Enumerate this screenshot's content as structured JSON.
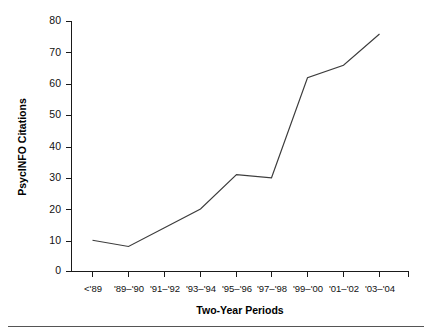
{
  "chart_data": {
    "type": "line",
    "title": "",
    "xlabel": "Two-Year Periods",
    "ylabel": "PsycINFO Citations",
    "categories": [
      "<'89",
      "'89–'90",
      "'91–'92",
      "'93–'94",
      "'95–'96",
      "'97–'98",
      "'99–'00",
      "'01–'02",
      "'03–'04"
    ],
    "values": [
      10,
      8,
      14,
      20,
      31,
      30,
      62,
      66,
      76
    ],
    "series": [
      {
        "name": "PsycINFO Citations",
        "values": [
          10,
          8,
          14,
          20,
          31,
          30,
          62,
          66,
          76
        ]
      }
    ],
    "ylim": [
      0,
      80
    ],
    "yticks": [
      0,
      10,
      20,
      30,
      40,
      50,
      60,
      70,
      80
    ],
    "ytick_labels": [
      "0",
      "10",
      "20",
      "30",
      "40",
      "50",
      "60",
      "70",
      "80"
    ],
    "grid": false,
    "legend": false,
    "line_color": "#3c3c3c",
    "axis_color": "#1a1a1a",
    "background": "#ffffff"
  },
  "axes": {
    "y_title": "PsycINFO Citations",
    "x_title": "Two-Year Periods"
  },
  "ticks": {
    "y": [
      {
        "label": "80",
        "value": 80
      },
      {
        "label": "70",
        "value": 70
      },
      {
        "label": "60",
        "value": 60
      },
      {
        "label": "50",
        "value": 50
      },
      {
        "label": "40",
        "value": 40
      },
      {
        "label": "30",
        "value": 30
      },
      {
        "label": "20",
        "value": 20
      },
      {
        "label": "10",
        "value": 10
      },
      {
        "label": "0",
        "value": 0
      }
    ],
    "x": [
      {
        "label": "<'89"
      },
      {
        "label": "'89–'90"
      },
      {
        "label": "'91–'92"
      },
      {
        "label": "'93–'94"
      },
      {
        "label": "'95–'96"
      },
      {
        "label": "'97–'98"
      },
      {
        "label": "'99–'00"
      },
      {
        "label": "'01–'02"
      },
      {
        "label": "'03–'04"
      }
    ]
  }
}
